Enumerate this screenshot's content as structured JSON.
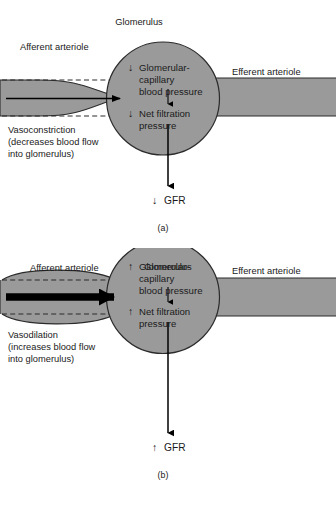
{
  "figure": {
    "title_visible": false,
    "colors": {
      "vessel_fill": "#9a9a9a",
      "vessel_stroke": "#2b2b2b",
      "background": "#ffffff",
      "text": "#1a1a1a",
      "flow_arrow": "#000000"
    }
  },
  "panels": [
    {
      "id": "(a)",
      "glomerulus_label": "Glomerulus",
      "afferent_label": "Afferent arteriole",
      "efferent_label": "Efferent arteriole",
      "inner_lines": [
        {
          "arrow": "↓",
          "text": "Glomerular-"
        },
        {
          "arrow": "",
          "text": "capillary"
        },
        {
          "arrow": "",
          "text": "blood pressure"
        }
      ],
      "inner_second": [
        {
          "arrow": "↓",
          "text": "Net filtration"
        },
        {
          "arrow": "",
          "text": "pressure"
        }
      ],
      "outcome": {
        "arrow": "↓",
        "text": "GFR"
      },
      "caption": {
        "heading": "Vasoconstriction",
        "lines": [
          "(decreases blood flow",
          "into glomerulus)"
        ]
      },
      "vessel_state": "constricted",
      "flow_arrow_weight": "thin"
    },
    {
      "id": "(b)",
      "glomerulus_label": "Glomerulus",
      "afferent_label": "Afferent arteriole",
      "efferent_label": "Efferent arteriole",
      "inner_lines": [
        {
          "arrow": "↑",
          "text": "Glomerular-"
        },
        {
          "arrow": "",
          "text": "capillary"
        },
        {
          "arrow": "",
          "text": "blood pressure"
        }
      ],
      "inner_second": [
        {
          "arrow": "↑",
          "text": "Net filtration"
        },
        {
          "arrow": "",
          "text": "pressure"
        }
      ],
      "outcome": {
        "arrow": "↑",
        "text": "GFR"
      },
      "caption": {
        "heading": "Vasodilation",
        "lines": [
          "(increases blood flow",
          "into glomerulus)"
        ]
      },
      "vessel_state": "dilated",
      "flow_arrow_weight": "thick"
    }
  ]
}
